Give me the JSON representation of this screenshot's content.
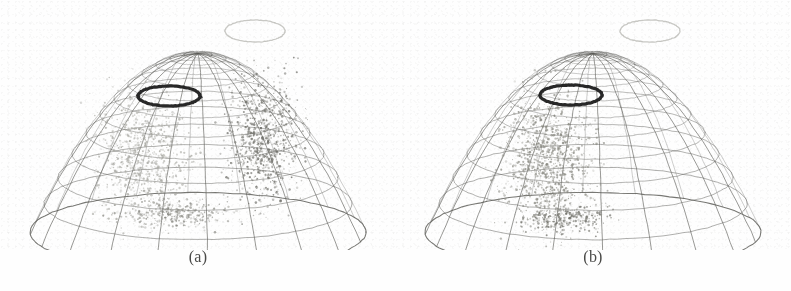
{
  "figure": {
    "background_color": "#fefefe",
    "ink_color": "#4a4a48",
    "panel_count": 2
  },
  "panels": [
    {
      "id": "panel-a",
      "caption": "(a)",
      "surface": {
        "name": "wireframe-paraboloid-bowl",
        "rings": 12,
        "meridians": 20,
        "stroke_color": "#5a5a56",
        "rim_top_y": 14,
        "bottom_y": 232,
        "rim_half_width": 168,
        "center_x": 197
      },
      "markers": [
        {
          "name": "dark-ellipse-marker",
          "style": "bold-dark-ring",
          "color": "#1c1c1c",
          "cx": 168,
          "cy": 96,
          "rx": 31,
          "ry": 10,
          "stroke_width": 3.2,
          "filled": false
        },
        {
          "name": "light-ellipse-marker",
          "style": "faint-light-ring",
          "color": "#9a9a94",
          "cx": 254,
          "cy": 31,
          "rx": 30,
          "ry": 11,
          "stroke_width": 1.3,
          "filled": false
        }
      ],
      "clusters": [
        {
          "name": "left-scatter-cluster",
          "tone": "light-gray",
          "color": "#a8a8a2",
          "point_count": 900,
          "cx": 142,
          "cy": 158,
          "rx": 44,
          "ry": 62,
          "density": "dense"
        },
        {
          "name": "right-scatter-cluster",
          "tone": "dark-gray",
          "color": "#6e6e68",
          "point_count": 820,
          "cx": 262,
          "cy": 140,
          "rx": 34,
          "ry": 58,
          "density": "dense"
        },
        {
          "name": "bottom-scatter-smear",
          "tone": "mid-gray",
          "color": "#8a8a84",
          "point_count": 320,
          "cx": 172,
          "cy": 214,
          "rx": 58,
          "ry": 14,
          "density": "medium"
        }
      ]
    },
    {
      "id": "panel-b",
      "caption": "(b)",
      "surface": {
        "name": "wireframe-paraboloid-bowl",
        "rings": 12,
        "meridians": 20,
        "stroke_color": "#5a5a56",
        "rim_top_y": 14,
        "bottom_y": 232,
        "rim_half_width": 168,
        "center_x": 197
      },
      "markers": [
        {
          "name": "dark-ellipse-marker",
          "style": "bold-dark-ring",
          "color": "#1c1c1c",
          "cx": 175,
          "cy": 95,
          "rx": 31,
          "ry": 10,
          "stroke_width": 3.2,
          "filled": false
        },
        {
          "name": "light-ellipse-marker",
          "style": "faint-light-ring",
          "color": "#9a9a94",
          "cx": 254,
          "cy": 31,
          "rx": 30,
          "ry": 11,
          "stroke_width": 1.3,
          "filled": false
        }
      ],
      "clusters": [
        {
          "name": "left-scatter-cluster",
          "tone": "mid-gray",
          "color": "#87877f",
          "point_count": 1150,
          "cx": 153,
          "cy": 163,
          "rx": 44,
          "ry": 66,
          "density": "dense"
        },
        {
          "name": "bottom-scatter-smear",
          "tone": "dark-gray",
          "color": "#6b6b64",
          "point_count": 280,
          "cx": 168,
          "cy": 218,
          "rx": 42,
          "ry": 13,
          "density": "medium"
        }
      ]
    }
  ],
  "chart_data": {
    "type": "scatter",
    "title": "",
    "subtitle": "",
    "xlabel": "",
    "ylabel": "",
    "grid": true,
    "legend": "none",
    "panels": [
      {
        "label": "(a)",
        "series": [
          {
            "name": "left-cluster",
            "tone": "light-gray",
            "approx_points": 900
          },
          {
            "name": "right-cluster",
            "tone": "dark-gray",
            "approx_points": 820
          },
          {
            "name": "bottom-smear",
            "tone": "mid-gray",
            "approx_points": 320
          }
        ],
        "annotations": [
          "dark-ellipse-marker",
          "light-ellipse-marker"
        ]
      },
      {
        "label": "(b)",
        "series": [
          {
            "name": "left-cluster",
            "tone": "mid-gray",
            "approx_points": 1150
          },
          {
            "name": "bottom-smear",
            "tone": "dark-gray",
            "approx_points": 280
          }
        ],
        "annotations": [
          "dark-ellipse-marker",
          "light-ellipse-marker"
        ]
      }
    ],
    "surface": {
      "shape": "paraboloid",
      "rings": 12,
      "meridians": 20
    }
  }
}
